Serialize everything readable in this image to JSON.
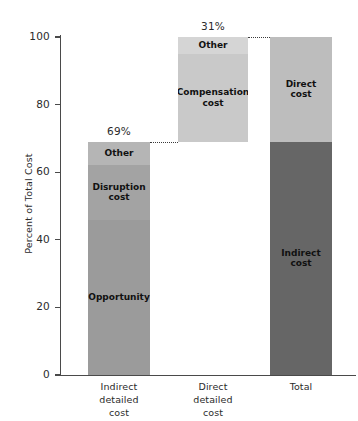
{
  "chart_data": {
    "type": "bar",
    "title": "",
    "subtitle": "",
    "xlabel": "",
    "ylabel": "Percent of Total Cost",
    "ylim": [
      0,
      100
    ],
    "yticks": [
      0,
      20,
      40,
      60,
      80,
      100
    ],
    "ytick_labels": [
      "0",
      "20",
      "40",
      "60",
      "80",
      "100"
    ],
    "grid": false,
    "legend": "none",
    "stacked": true,
    "categories": [
      "Indirect detailed cost",
      "Direct detailed cost",
      "Total"
    ],
    "category_lines": [
      [
        "Indirect",
        "detailed",
        "cost"
      ],
      [
        "Direct",
        "detailed",
        "cost"
      ],
      [
        "Total"
      ]
    ],
    "bars": [
      {
        "category": "Indirect detailed cost",
        "base": 0,
        "top": 69,
        "callout": "69%",
        "segments": [
          {
            "label": "Opportunity",
            "label_lines": [
              "Opportunity"
            ],
            "from": 0,
            "to": 46,
            "value": 46,
            "color": "#9b9b9b"
          },
          {
            "label": "Disruption cost",
            "label_lines": [
              "Disruption",
              "cost"
            ],
            "from": 46,
            "to": 62,
            "value": 16,
            "color": "#a3a3a3"
          },
          {
            "label": "Other",
            "label_lines": [
              "Other"
            ],
            "from": 62,
            "to": 69,
            "value": 7,
            "color": "#b5b5b5"
          }
        ]
      },
      {
        "category": "Direct detailed cost",
        "base": 69,
        "top": 100,
        "callout": "31%",
        "segments": [
          {
            "label": "Compensation cost",
            "label_lines": [
              "Compensation",
              "cost"
            ],
            "from": 69,
            "to": 95,
            "value": 26,
            "color": "#c9c9c9"
          },
          {
            "label": "Other",
            "label_lines": [
              "Other"
            ],
            "from": 95,
            "to": 100,
            "value": 5,
            "color": "#d5d5d5"
          }
        ]
      },
      {
        "category": "Total",
        "base": 0,
        "top": 100,
        "callout": "",
        "segments": [
          {
            "label": "Indirect cost",
            "label_lines": [
              "Indirect",
              "cost"
            ],
            "from": 0,
            "to": 69,
            "value": 69,
            "color": "#666666"
          },
          {
            "label": "Direct cost",
            "label_lines": [
              "Direct",
              "cost"
            ],
            "from": 69,
            "to": 100,
            "value": 31,
            "color": "#bdbdbd"
          }
        ]
      }
    ],
    "connectors": [
      {
        "name": "connector-69-bar1-to-bar2",
        "level": 69
      },
      {
        "name": "connector-100-bar2-to-bar3",
        "level": 100
      }
    ],
    "colors": {
      "opportunity": "#9b9b9b",
      "disruption_cost": "#a3a3a3",
      "other_indirect": "#b5b5b5",
      "compensation_cost": "#c9c9c9",
      "other_direct": "#d5d5d5",
      "indirect_cost": "#666666",
      "direct_cost": "#bdbdbd",
      "axis": "#4a4a4a",
      "text": "#2b2b2b",
      "background": "#ffffff"
    }
  },
  "yticks_text": {
    "t0": "0",
    "t20": "20",
    "t40": "40",
    "t60": "60",
    "t80": "80",
    "t100": "100"
  }
}
